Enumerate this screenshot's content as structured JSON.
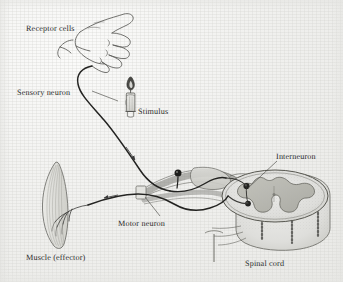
{
  "figure": {
    "background_color": "#f1f1ef",
    "ink_color": "#2c2c2c",
    "label_color": "#2c2c2c"
  },
  "labels": {
    "receptor_cells": "Receptor cells",
    "sensory_neuron": "Sensory neuron",
    "stimulus": "Stimulus",
    "interneuron": "Interneuron",
    "motor_neuron": "Motor neuron",
    "muscle_effector": "Muscle (effector)",
    "spinal_cord": "Spinal cord"
  },
  "structures": [
    {
      "name": "hand",
      "label": "Receptor cells",
      "description": "line-drawn hand with curling fingers at upper area"
    },
    {
      "name": "candle",
      "label": "Stimulus",
      "description": "lit candle with flame below the hand"
    },
    {
      "name": "sensory-neuron-fiber",
      "label": "Sensory neuron",
      "description": "dark curved fiber from hand down to spinal nerve"
    },
    {
      "name": "dorsal-root-ganglion",
      "label": "",
      "description": "dark pin-shaped cell body on the dorsal root"
    },
    {
      "name": "spinal-nerve-bundle",
      "label": "",
      "description": "shaded nerve trunk entering the spinal cord"
    },
    {
      "name": "spinal-cord-cross-section",
      "label": "Spinal cord",
      "description": "oval cross-section with butterfly-shaped gray matter"
    },
    {
      "name": "interneuron-synapse",
      "label": "Interneuron",
      "description": "two dark synaptic cell bodies inside the gray matter"
    },
    {
      "name": "motor-neuron-fiber",
      "label": "Motor neuron",
      "description": "dark fiber from spinal cord out to the muscle"
    },
    {
      "name": "muscle",
      "label": "Muscle (effector)",
      "description": "spindle-shaped striated muscle with nerve branches"
    }
  ],
  "flow_arrows": [
    {
      "name": "sensory-direction-arrow",
      "direction": "toward spinal cord"
    },
    {
      "name": "motor-direction-arrow",
      "direction": "toward muscle"
    }
  ]
}
